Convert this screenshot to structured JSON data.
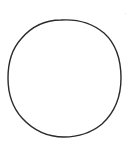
{
  "diagram": {
    "shape": "circle",
    "stroke_color": "#2a2a2a",
    "fill_color": "#ffffff",
    "background_color": "#ffffff",
    "center": [
      64,
      78
    ],
    "radius": 57,
    "stroke_width": 1.4
  }
}
